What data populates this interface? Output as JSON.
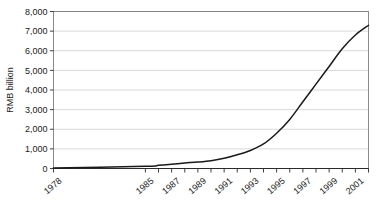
{
  "chart_data": {
    "type": "line",
    "title": "",
    "xlabel": "",
    "ylabel": "RMB billion",
    "ylim": [
      0,
      8000
    ],
    "ytick_values": [
      0,
      1000,
      2000,
      3000,
      4000,
      5000,
      6000,
      7000,
      8000
    ],
    "ytick_labels": [
      "0",
      "1,000",
      "2,000",
      "3,000",
      "4,000",
      "5,000",
      "6,000",
      "7,000",
      "8,000"
    ],
    "xlim": [
      1978,
      2002
    ],
    "grid": true,
    "legend": false,
    "x": [
      1978,
      1985,
      1986,
      1987,
      1988,
      1989,
      1990,
      1991,
      1992,
      1993,
      1994,
      1995,
      1996,
      1997,
      1998,
      1999,
      2000,
      2001,
      2002
    ],
    "xtick_labels": [
      "1978",
      "1985",
      "1987",
      "1989",
      "1991",
      "1993",
      "1995",
      "1997",
      "1999",
      "2001"
    ],
    "xtick_positions": [
      1978,
      1985,
      1987,
      1989,
      1991,
      1993,
      1995,
      1997,
      1999,
      2001
    ],
    "series": [
      {
        "name": "RMB billion",
        "values": [
          20,
          110,
          160,
          220,
          280,
          330,
          400,
          520,
          700,
          920,
          1250,
          1800,
          2500,
          3400,
          4300,
          5200,
          6100,
          6800,
          7300
        ]
      }
    ],
    "line_color": "#1a1a1a",
    "grid_color": "#c9c9c9",
    "axis_color": "#2b2b2b"
  }
}
